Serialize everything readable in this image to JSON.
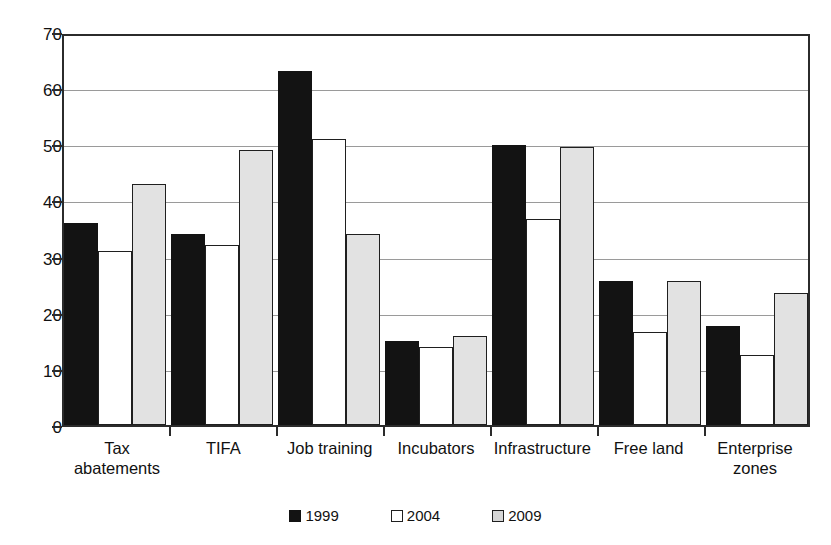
{
  "chart_data": {
    "type": "bar",
    "title": "",
    "subtitle": "",
    "xlabel": "",
    "ylabel": "",
    "ylim": [
      0,
      70
    ],
    "ytick_values": [
      0,
      10,
      20,
      30,
      40,
      50,
      60,
      70
    ],
    "ytick_labels": [
      "0",
      "10",
      "20",
      "30",
      "40",
      "50",
      "60",
      "70"
    ],
    "grid": true,
    "legend_position": "bottom-center",
    "categories": [
      "Tax abatements",
      "TIFA",
      "Job training",
      "Incubators",
      "Infrastructure",
      "Free land",
      "Enterprise zones"
    ],
    "category_lines": [
      [
        "Tax",
        "abatements"
      ],
      [
        "TIFA",
        ""
      ],
      [
        "Job training",
        ""
      ],
      [
        "Incubators",
        ""
      ],
      [
        "Infrastructure",
        ""
      ],
      [
        "Free land",
        ""
      ],
      [
        "Enterprise",
        "zones"
      ]
    ],
    "series": [
      {
        "name": "1999",
        "color": "#131313",
        "values": [
          36,
          34,
          63,
          15,
          49.8,
          25.7,
          17.6
        ]
      },
      {
        "name": "2004",
        "color": "#ffffff",
        "values": [
          31,
          32,
          51,
          13.9,
          36.7,
          16.6,
          12.5
        ]
      },
      {
        "name": "2009",
        "color": "#e2e2e2",
        "values": [
          43,
          49,
          34,
          15.8,
          49.5,
          25.6,
          23.5
        ]
      }
    ]
  },
  "legend": {
    "items": [
      {
        "label": "1999",
        "swatch_class": "s1999"
      },
      {
        "label": "2004",
        "swatch_class": "s2004"
      },
      {
        "label": "2009",
        "swatch_class": "s2009"
      }
    ]
  },
  "colors": {
    "axis": "#2b2b2b",
    "gridline": "#9a9a9a",
    "series_1999": "#131313",
    "series_2004": "#ffffff",
    "series_2009": "#e2e2e2",
    "background": "#ffffff"
  }
}
